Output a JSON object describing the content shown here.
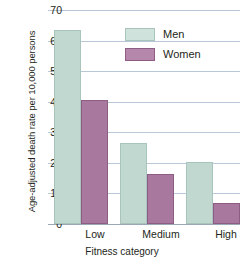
{
  "chart_data": {
    "type": "bar",
    "title": "",
    "xlabel": "Fitness category",
    "ylabel": "Age-adjusted death rate per 10,000 persons",
    "categories": [
      "Low",
      "Medium",
      "High"
    ],
    "series": [
      {
        "name": "Men",
        "color": "#c1d8d0",
        "values": [
          63.5,
          26.5,
          20.3
        ]
      },
      {
        "name": "Women",
        "color": "#a8789f",
        "values": [
          40.5,
          16.3,
          7.0
        ]
      }
    ],
    "ylim": [
      0,
      70
    ],
    "yticks": [
      0,
      10,
      20,
      30,
      40,
      50,
      60,
      70
    ],
    "ytick_labels": [
      "0",
      "10",
      "20",
      "30",
      "40",
      "50",
      "60",
      "70"
    ],
    "grid": true,
    "legend_position": "top-right-inside"
  },
  "axes": {
    "y_title": "Age-adjusted death rate per 10,000 persons",
    "x_title": "Fitness category",
    "y_tick_0": "0",
    "y_tick_1": "10",
    "y_tick_2": "20",
    "y_tick_3": "30",
    "y_tick_4": "40",
    "y_tick_5": "50",
    "y_tick_6": "60",
    "y_tick_7": "70",
    "x_tick_0": "Low",
    "x_tick_1": "Medium",
    "x_tick_2": "High"
  },
  "legend": {
    "items": [
      {
        "label": "Men",
        "color": "#c1d8d0"
      },
      {
        "label": "Women",
        "color": "#a8789f"
      }
    ]
  }
}
